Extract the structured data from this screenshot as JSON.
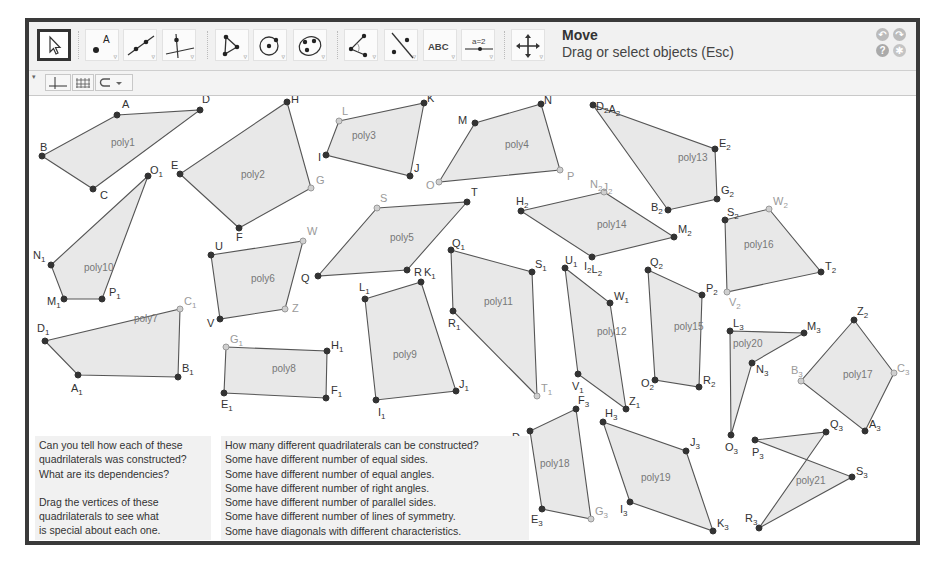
{
  "toolbar": {
    "tools": [
      {
        "name": "move-tool",
        "icon": "pointer-arrow-icon",
        "active": true
      },
      {
        "name": "point-tool",
        "icon": "point-icon",
        "label": "A"
      },
      {
        "name": "line-tool",
        "icon": "line-through-points-icon"
      },
      {
        "name": "perpendicular-line-tool",
        "icon": "perpendicular-line-icon"
      },
      {
        "name": "polygon-tool",
        "icon": "polygon-icon"
      },
      {
        "name": "circle-tool",
        "icon": "circle-center-point-icon"
      },
      {
        "name": "conic-tool",
        "icon": "ellipse-icon"
      },
      {
        "name": "angle-tool",
        "icon": "angle-icon"
      },
      {
        "name": "reflect-tool",
        "icon": "reflect-about-line-icon"
      },
      {
        "name": "text-tool",
        "icon": "text-icon",
        "label": "ABC"
      },
      {
        "name": "slider-tool",
        "icon": "slider-icon",
        "label": "a=2"
      },
      {
        "name": "move-graphics-view-tool",
        "icon": "move-view-icon"
      }
    ],
    "current_tool_name": "Move",
    "current_tool_description": "Drag or select objects (Esc)",
    "undo_icon": "undo-icon",
    "redo_icon": "redo-icon",
    "help_icon": "help-icon",
    "settings_icon": "gear-icon"
  },
  "stylebar": {
    "buttons": [
      {
        "name": "show-axes-toggle",
        "icon": "axes-icon"
      },
      {
        "name": "show-grid-toggle",
        "icon": "grid-icon"
      },
      {
        "name": "point-capturing-dropdown",
        "icon": "magnet-icon"
      }
    ]
  },
  "colors": {
    "fill": "#e4e4e4",
    "edge": "#555555",
    "free_point": "#333333",
    "dependent_point": "#9a9a9a",
    "label": "#333333",
    "poly_label": "#777777",
    "frame": "#3a3a3a"
  },
  "texts": {
    "left_block": [
      "Can you tell how each of these",
      "quadrilaterals was constructed?",
      "What are its dependencies?",
      "",
      "Drag the vertices of these",
      "quadrilaterals to see what",
      "is special about each one."
    ],
    "right_block": [
      "How many different quadrilaterals can be constructed?",
      "Some have different number of equal sides.",
      "Some have different number of equal angles.",
      "Some have different number of right angles.",
      "Some have different number of parallel sides.",
      "Some have different number of lines of symmetry.",
      "Some have diagonals with different characteristics."
    ]
  },
  "polygons": [
    {
      "name": "poly1",
      "label_pos": [
        111,
        146
      ],
      "points": [
        {
          "l": "A",
          "x": 117,
          "y": 115,
          "dep": false,
          "lx": 122,
          "ly": 108
        },
        {
          "l": "D",
          "x": 200,
          "y": 110,
          "dep": false,
          "lx": 202,
          "ly": 103
        },
        {
          "l": "C",
          "x": 93,
          "y": 189,
          "dep": false,
          "lx": 100,
          "ly": 199
        },
        {
          "l": "B",
          "x": 42,
          "y": 156,
          "dep": false,
          "lx": 40,
          "ly": 151
        }
      ]
    },
    {
      "name": "poly2",
      "label_pos": [
        241,
        178
      ],
      "points": [
        {
          "l": "H",
          "x": 287,
          "y": 102,
          "dep": false,
          "lx": 291,
          "ly": 103
        },
        {
          "l": "G",
          "x": 311,
          "y": 188,
          "dep": true,
          "lx": 316,
          "ly": 184
        },
        {
          "l": "F",
          "x": 239,
          "y": 228,
          "dep": false,
          "lx": 236,
          "ly": 241
        },
        {
          "l": "E",
          "x": 180,
          "y": 174,
          "dep": false,
          "lx": 171,
          "ly": 169
        }
      ]
    },
    {
      "name": "poly3",
      "label_pos": [
        352,
        139
      ],
      "points": [
        {
          "l": "L",
          "x": 339,
          "y": 121,
          "dep": true,
          "lx": 342,
          "ly": 115
        },
        {
          "l": "K",
          "x": 424,
          "y": 103,
          "dep": false,
          "lx": 427,
          "ly": 102
        },
        {
          "l": "J",
          "x": 410,
          "y": 176,
          "dep": false,
          "lx": 414,
          "ly": 172
        },
        {
          "l": "I",
          "x": 326,
          "y": 155,
          "dep": false,
          "lx": 318,
          "ly": 161
        }
      ]
    },
    {
      "name": "poly4",
      "label_pos": [
        505,
        148
      ],
      "points": [
        {
          "l": "M",
          "x": 475,
          "y": 123,
          "dep": false,
          "lx": 458,
          "ly": 124
        },
        {
          "l": "N",
          "x": 541,
          "y": 104,
          "dep": false,
          "lx": 544,
          "ly": 104
        },
        {
          "l": "P",
          "x": 560,
          "y": 170,
          "dep": true,
          "lx": 567,
          "ly": 180
        },
        {
          "l": "O",
          "x": 439,
          "y": 182,
          "dep": true,
          "lx": 426,
          "ly": 189
        }
      ]
    },
    {
      "name": "poly5",
      "label_pos": [
        390,
        241
      ],
      "points": [
        {
          "l": "S",
          "x": 377,
          "y": 208,
          "dep": true,
          "lx": 380,
          "ly": 202
        },
        {
          "l": "T",
          "x": 467,
          "y": 202,
          "dep": false,
          "lx": 471,
          "ly": 196
        },
        {
          "l": "R",
          "x": 407,
          "y": 270,
          "dep": false,
          "lx": 414,
          "ly": 276
        },
        {
          "l": "Q",
          "x": 318,
          "y": 276,
          "dep": false,
          "lx": 301,
          "ly": 282
        }
      ]
    },
    {
      "name": "poly6",
      "label_pos": [
        251,
        282
      ],
      "points": [
        {
          "l": "U",
          "x": 211,
          "y": 255,
          "dep": false,
          "lx": 215,
          "ly": 250
        },
        {
          "l": "W",
          "x": 303,
          "y": 241,
          "dep": true,
          "lx": 307,
          "ly": 235
        },
        {
          "l": "Z",
          "x": 285,
          "y": 309,
          "dep": true,
          "lx": 292,
          "ly": 312
        },
        {
          "l": "V",
          "x": 220,
          "y": 319,
          "dep": false,
          "lx": 207,
          "ly": 327
        }
      ]
    },
    {
      "name": "poly7",
      "label_pos": [
        134,
        322
      ],
      "points": [
        {
          "l": "D1",
          "x": 45,
          "y": 341,
          "dep": false,
          "lx": 37,
          "ly": 332
        },
        {
          "l": "C1",
          "x": 180,
          "y": 309,
          "dep": true,
          "lx": 184,
          "ly": 305
        },
        {
          "l": "B1",
          "x": 178,
          "y": 377,
          "dep": false,
          "lx": 182,
          "ly": 372
        },
        {
          "l": "A1",
          "x": 78,
          "y": 375,
          "dep": false,
          "lx": 71,
          "ly": 392
        }
      ]
    },
    {
      "name": "poly8",
      "label_pos": [
        272,
        372
      ],
      "points": [
        {
          "l": "G1",
          "x": 226,
          "y": 347,
          "dep": true,
          "lx": 230,
          "ly": 343
        },
        {
          "l": "H1",
          "x": 327,
          "y": 351,
          "dep": false,
          "lx": 331,
          "ly": 349
        },
        {
          "l": "F1",
          "x": 326,
          "y": 398,
          "dep": false,
          "lx": 331,
          "ly": 394
        },
        {
          "l": "E1",
          "x": 224,
          "y": 393,
          "dep": false,
          "lx": 221,
          "ly": 408
        }
      ]
    },
    {
      "name": "poly9",
      "label_pos": [
        393,
        358
      ],
      "points": [
        {
          "l": "L1",
          "x": 365,
          "y": 299,
          "dep": false,
          "lx": 359,
          "ly": 291
        },
        {
          "l": "K1",
          "x": 421,
          "y": 282,
          "dep": false,
          "lx": 424,
          "ly": 276
        },
        {
          "l": "J1",
          "x": 456,
          "y": 391,
          "dep": false,
          "lx": 459,
          "ly": 388
        },
        {
          "l": "I1",
          "x": 376,
          "y": 400,
          "dep": false,
          "lx": 378,
          "ly": 416
        }
      ]
    },
    {
      "name": "poly11",
      "label_pos": [
        484,
        305
      ],
      "points": [
        {
          "l": "Q1",
          "x": 451,
          "y": 250,
          "dep": false,
          "lx": 452,
          "ly": 247
        },
        {
          "l": "S1",
          "x": 532,
          "y": 272,
          "dep": false,
          "lx": 535,
          "ly": 268
        },
        {
          "l": "T1",
          "x": 537,
          "y": 396,
          "dep": true,
          "lx": 541,
          "ly": 392
        },
        {
          "l": "R1",
          "x": 453,
          "y": 311,
          "dep": false,
          "lx": 448,
          "ly": 327
        }
      ]
    },
    {
      "name": "poly10",
      "label_pos": [
        84,
        271
      ],
      "points": [
        {
          "l": "O1",
          "x": 148,
          "y": 176,
          "dep": false,
          "lx": 150,
          "ly": 174
        },
        {
          "l": "P1",
          "x": 102,
          "y": 299,
          "dep": false,
          "lx": 109,
          "ly": 296
        },
        {
          "l": "M1",
          "x": 64,
          "y": 299,
          "dep": false,
          "lx": 47,
          "ly": 305
        },
        {
          "l": "N1",
          "x": 51,
          "y": 265,
          "dep": false,
          "lx": 33,
          "ly": 259
        }
      ]
    },
    {
      "name": "poly12",
      "label_pos": [
        597,
        335
      ],
      "points": [
        {
          "l": "U1",
          "x": 565,
          "y": 268,
          "dep": false,
          "lx": 565,
          "ly": 264
        },
        {
          "l": "W1",
          "x": 610,
          "y": 303,
          "dep": false,
          "lx": 614,
          "ly": 300
        },
        {
          "l": "Z1",
          "x": 626,
          "y": 409,
          "dep": false,
          "lx": 629,
          "ly": 405
        },
        {
          "l": "V1",
          "x": 578,
          "y": 374,
          "dep": false,
          "lx": 572,
          "ly": 390
        }
      ]
    },
    {
      "name": "poly13",
      "label_pos": [
        678,
        161
      ],
      "points": [
        {
          "l": "D2A2",
          "x": 593,
          "y": 105,
          "dep": false,
          "lx": 596,
          "ly": 110
        },
        {
          "l": "E2",
          "x": 715,
          "y": 149,
          "dep": false,
          "lx": 719,
          "ly": 147
        },
        {
          "l": "G2",
          "x": 717,
          "y": 199,
          "dep": false,
          "lx": 721,
          "ly": 194
        },
        {
          "l": "B2",
          "x": 668,
          "y": 210,
          "dep": false,
          "lx": 651,
          "ly": 211
        }
      ]
    },
    {
      "name": "poly14",
      "label_pos": [
        597,
        228
      ],
      "points": [
        {
          "l": "N2J2",
          "x": 604,
          "y": 192,
          "dep": true,
          "lx": 590,
          "ly": 188
        },
        {
          "l": "M2",
          "x": 674,
          "y": 237,
          "dep": false,
          "lx": 678,
          "ly": 233
        },
        {
          "l": "I2L2",
          "x": 592,
          "y": 257,
          "dep": false,
          "lx": 584,
          "ly": 270
        },
        {
          "l": "H2",
          "x": 521,
          "y": 211,
          "dep": false,
          "lx": 516,
          "ly": 205
        }
      ]
    },
    {
      "name": "poly15",
      "label_pos": [
        674,
        330
      ],
      "points": [
        {
          "l": "Q2",
          "x": 648,
          "y": 270,
          "dep": false,
          "lx": 650,
          "ly": 266
        },
        {
          "l": "P2",
          "x": 702,
          "y": 295,
          "dep": false,
          "lx": 706,
          "ly": 292
        },
        {
          "l": "R2",
          "x": 699,
          "y": 387,
          "dep": false,
          "lx": 703,
          "ly": 384
        },
        {
          "l": "O2",
          "x": 655,
          "y": 380,
          "dep": false,
          "lx": 641,
          "ly": 387
        }
      ]
    },
    {
      "name": "poly16",
      "label_pos": [
        744,
        248
      ],
      "points": [
        {
          "l": "S2",
          "x": 725,
          "y": 220,
          "dep": false,
          "lx": 727,
          "ly": 216
        },
        {
          "l": "W2",
          "x": 769,
          "y": 209,
          "dep": true,
          "lx": 773,
          "ly": 205
        },
        {
          "l": "T2",
          "x": 821,
          "y": 272,
          "dep": false,
          "lx": 825,
          "ly": 270
        },
        {
          "l": "V2",
          "x": 727,
          "y": 292,
          "dep": true,
          "lx": 729,
          "ly": 306
        }
      ]
    },
    {
      "name": "poly17",
      "label_pos": [
        843,
        378
      ],
      "points": [
        {
          "l": "Z2",
          "x": 854,
          "y": 320,
          "dep": false,
          "lx": 857,
          "ly": 315
        },
        {
          "l": "C3",
          "x": 894,
          "y": 373,
          "dep": true,
          "lx": 897,
          "ly": 372
        },
        {
          "l": "A3",
          "x": 865,
          "y": 431,
          "dep": false,
          "lx": 869,
          "ly": 428
        },
        {
          "l": "B3",
          "x": 801,
          "y": 381,
          "dep": true,
          "lx": 791,
          "ly": 374
        }
      ]
    },
    {
      "name": "poly20",
      "label_pos": [
        733,
        347
      ],
      "points": [
        {
          "l": "L3",
          "x": 730,
          "y": 331,
          "dep": false,
          "lx": 733,
          "ly": 327
        },
        {
          "l": "M3",
          "x": 804,
          "y": 333,
          "dep": false,
          "lx": 807,
          "ly": 330
        },
        {
          "l": "N3",
          "x": 752,
          "y": 363,
          "dep": false,
          "lx": 756,
          "ly": 373
        },
        {
          "l": "O3",
          "x": 731,
          "y": 435,
          "dep": false,
          "lx": 725,
          "ly": 451
        }
      ]
    },
    {
      "name": "poly18",
      "label_pos": [
        540,
        467
      ],
      "points": [
        {
          "l": "F3",
          "x": 576,
          "y": 409,
          "dep": false,
          "lx": 578,
          "ly": 404
        },
        {
          "l": "G3",
          "x": 591,
          "y": 519,
          "dep": true,
          "lx": 595,
          "ly": 515
        },
        {
          "l": "E3",
          "x": 542,
          "y": 509,
          "dep": false,
          "lx": 531,
          "ly": 523
        },
        {
          "l": "D3",
          "x": 530,
          "y": 431,
          "dep": false,
          "lx": 512,
          "ly": 441
        }
      ]
    },
    {
      "name": "poly19",
      "label_pos": [
        641,
        481
      ],
      "points": [
        {
          "l": "H3",
          "x": 603,
          "y": 422,
          "dep": false,
          "lx": 605,
          "ly": 417
        },
        {
          "l": "J3",
          "x": 686,
          "y": 451,
          "dep": false,
          "lx": 690,
          "ly": 446
        },
        {
          "l": "K3",
          "x": 713,
          "y": 531,
          "dep": false,
          "lx": 717,
          "ly": 527
        },
        {
          "l": "I3",
          "x": 630,
          "y": 502,
          "dep": false,
          "lx": 620,
          "ly": 513
        }
      ]
    },
    {
      "name": "poly21",
      "label_pos": [
        796,
        484
      ],
      "points": [
        {
          "l": "P3",
          "x": 755,
          "y": 440,
          "dep": false,
          "lx": 752,
          "ly": 456
        },
        {
          "l": "Q3",
          "x": 826,
          "y": 432,
          "dep": false,
          "lx": 830,
          "ly": 428
        },
        {
          "l": "R3",
          "x": 759,
          "y": 528,
          "dep": false,
          "lx": 745,
          "ly": 522
        },
        {
          "l": "S3",
          "x": 852,
          "y": 477,
          "dep": false,
          "lx": 856,
          "ly": 475
        }
      ]
    }
  ]
}
